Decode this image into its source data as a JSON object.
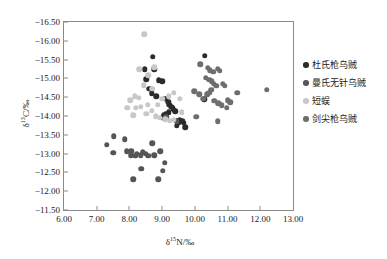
{
  "chart_data": {
    "type": "scatter",
    "title": "",
    "xlabel": "δ¹⁵N/‰",
    "ylabel": "δ¹³C/‰",
    "xlim": [
      6.0,
      13.0
    ],
    "ylim": [
      -16.5,
      -11.5
    ],
    "xticks": [
      "6.00",
      "7.00",
      "8.00",
      "9.00",
      "10.00",
      "11.00",
      "12.00",
      "13.00"
    ],
    "yticks": [
      "-16.50",
      "-16.00",
      "-15.50",
      "-15.00",
      "-14.50",
      "-14.00",
      "-13.50",
      "-13.00",
      "-12.50",
      "-12.00",
      "-11.50"
    ],
    "grid": false,
    "legend_position": "right",
    "y_axis_inverted": true,
    "series": [
      {
        "name": "杜氏枪乌贼",
        "color": "#2b2b2b",
        "points": [
          [
            8.72,
            -15.58
          ],
          [
            8.47,
            -15.25
          ],
          [
            8.76,
            -15.25
          ],
          [
            8.52,
            -14.98
          ],
          [
            8.9,
            -14.95
          ],
          [
            9.0,
            -14.92
          ],
          [
            8.6,
            -14.72
          ],
          [
            8.68,
            -14.6
          ],
          [
            8.82,
            -14.52
          ],
          [
            9.1,
            -14.46
          ],
          [
            9.18,
            -14.38
          ],
          [
            9.22,
            -14.3
          ],
          [
            9.28,
            -14.24
          ],
          [
            9.32,
            -14.2
          ],
          [
            9.36,
            -14.16
          ],
          [
            9.4,
            -14.12
          ],
          [
            9.2,
            -14.1
          ],
          [
            9.12,
            -14.06
          ],
          [
            9.06,
            -14.02
          ],
          [
            9.0,
            -13.96
          ],
          [
            9.46,
            -13.88
          ],
          [
            9.5,
            -13.84
          ],
          [
            9.54,
            -13.9
          ],
          [
            9.62,
            -13.86
          ],
          [
            9.66,
            -13.82
          ],
          [
            9.44,
            -13.74
          ],
          [
            10.3,
            -15.6
          ],
          [
            10.28,
            -14.44
          ],
          [
            9.7,
            -13.7
          ]
        ]
      },
      {
        "name": "曼氏无针乌贼",
        "color": "#555555",
        "points": [
          [
            7.3,
            -13.24
          ],
          [
            7.52,
            -13.46
          ],
          [
            7.5,
            -13.02
          ],
          [
            7.86,
            -13.38
          ],
          [
            7.92,
            -13.06
          ],
          [
            8.04,
            -12.96
          ],
          [
            8.06,
            -13.06
          ],
          [
            8.18,
            -12.94
          ],
          [
            8.22,
            -13.0
          ],
          [
            8.34,
            -12.96
          ],
          [
            8.36,
            -12.6
          ],
          [
            8.12,
            -12.32
          ],
          [
            8.5,
            -13.0
          ],
          [
            8.58,
            -12.94
          ],
          [
            8.7,
            -13.28
          ],
          [
            8.76,
            -12.96
          ],
          [
            8.94,
            -13.06
          ],
          [
            9.02,
            -12.54
          ],
          [
            9.08,
            -12.76
          ],
          [
            8.88,
            -12.32
          ],
          [
            8.4,
            -13.04
          ],
          [
            9.12,
            -13.98
          ],
          [
            9.44,
            -13.86
          ]
        ]
      },
      {
        "name": "短蜈",
        "color": "#c8c8c8",
        "points": [
          [
            8.46,
            -16.18
          ],
          [
            8.3,
            -15.24
          ],
          [
            8.76,
            -15.3
          ],
          [
            8.58,
            -15.08
          ],
          [
            8.44,
            -14.82
          ],
          [
            8.7,
            -14.72
          ],
          [
            8.16,
            -14.52
          ],
          [
            8.28,
            -14.48
          ],
          [
            8.02,
            -14.42
          ],
          [
            8.2,
            -14.22
          ],
          [
            8.34,
            -14.24
          ],
          [
            8.56,
            -14.3
          ],
          [
            8.68,
            -14.14
          ],
          [
            8.86,
            -14.3
          ],
          [
            9.0,
            -14.46
          ],
          [
            9.2,
            -14.52
          ],
          [
            9.36,
            -14.62
          ],
          [
            9.54,
            -14.46
          ],
          [
            9.6,
            -14.1
          ],
          [
            9.1,
            -13.92
          ],
          [
            9.24,
            -13.88
          ],
          [
            9.36,
            -13.9
          ],
          [
            8.8,
            -14.0
          ],
          [
            8.52,
            -14.06
          ],
          [
            8.12,
            -14.02
          ],
          [
            7.94,
            -14.22
          ],
          [
            8.92,
            -13.96
          ]
        ]
      },
      {
        "name": "剑尖枪乌贼",
        "color": "#6e6e6e",
        "points": [
          [
            10.16,
            -15.38
          ],
          [
            10.4,
            -15.28
          ],
          [
            10.46,
            -15.22
          ],
          [
            10.56,
            -15.18
          ],
          [
            10.7,
            -15.26
          ],
          [
            10.76,
            -15.2
          ],
          [
            10.34,
            -15.02
          ],
          [
            10.44,
            -14.96
          ],
          [
            10.52,
            -14.92
          ],
          [
            10.58,
            -14.86
          ],
          [
            10.66,
            -14.8
          ],
          [
            10.5,
            -14.7
          ],
          [
            10.44,
            -14.62
          ],
          [
            10.38,
            -14.58
          ],
          [
            10.86,
            -14.86
          ],
          [
            10.92,
            -14.8
          ],
          [
            10.26,
            -14.46
          ],
          [
            10.6,
            -14.4
          ],
          [
            10.72,
            -14.34
          ],
          [
            10.82,
            -14.28
          ],
          [
            11.0,
            -14.42
          ],
          [
            11.08,
            -14.36
          ],
          [
            10.98,
            -14.22
          ],
          [
            11.3,
            -14.62
          ],
          [
            12.2,
            -14.7
          ],
          [
            10.04,
            -13.98
          ],
          [
            10.7,
            -13.86
          ],
          [
            9.98,
            -14.66
          ],
          [
            10.14,
            -14.58
          ]
        ]
      }
    ]
  }
}
